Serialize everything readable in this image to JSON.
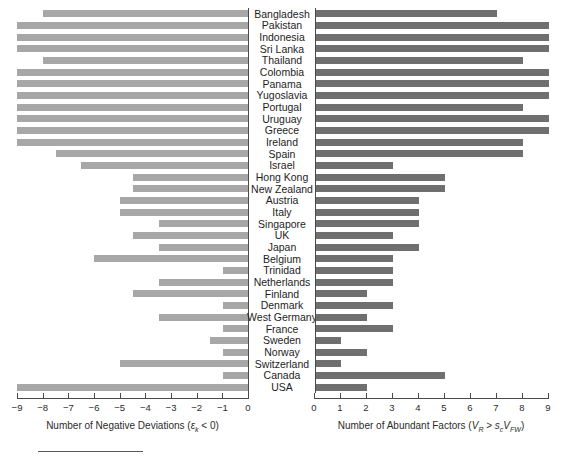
{
  "chart_data": {
    "type": "bar",
    "title": "",
    "orientation": "horizontal",
    "panels": "two-sided diverging (butterfly) bar chart",
    "categories": [
      "Bangladesh",
      "Pakistan",
      "Indonesia",
      "Sri Lanka",
      "Thailand",
      "Colombia",
      "Panama",
      "Yugoslavia",
      "Portugal",
      "Uruguay",
      "Greece",
      "Ireland",
      "Spain",
      "Israel",
      "Hong Kong",
      "New Zealand",
      "Austria",
      "Italy",
      "Singapore",
      "UK",
      "Japan",
      "Belgium",
      "Trinidad",
      "Netherlands",
      "Finland",
      "Denmark",
      "West Germany",
      "France",
      "Sweden",
      "Norway",
      "Switzerland",
      "Canada",
      "USA"
    ],
    "series": [
      {
        "name": "Number of Negative Deviations",
        "axis": "left",
        "color": "#a7a7a7",
        "direction": "left",
        "xlabel": "Number of Negative Deviations (εk < 0)",
        "xlim": [
          -9,
          0
        ],
        "xticks": [
          -9,
          -8,
          -7,
          -6,
          -5,
          -4,
          -3,
          -2,
          -1,
          0
        ],
        "values": [
          -8,
          -9,
          -9,
          -9,
          -8,
          -9,
          -9,
          -9,
          -9,
          -9,
          -9,
          -9,
          -7.5,
          -6.5,
          -4.5,
          -4.5,
          -5,
          -5,
          -3.5,
          -4.5,
          -3.5,
          -6,
          -1,
          -3.5,
          -4.5,
          -1,
          -3.5,
          -1,
          -1.5,
          -1,
          -5,
          -1,
          -9
        ]
      },
      {
        "name": "Number of Abundant Factors",
        "axis": "right",
        "color": "#6f6f6f",
        "direction": "right",
        "xlabel": "Number of Abundant Factors (VR > sc VFW)",
        "xlim": [
          0,
          9
        ],
        "xticks": [
          0,
          1,
          2,
          3,
          4,
          5,
          6,
          7,
          8,
          9
        ],
        "values": [
          7,
          9,
          9,
          9,
          8,
          9,
          9,
          9,
          8,
          9,
          9,
          8,
          8,
          3,
          5,
          5,
          4,
          4,
          4,
          3,
          4,
          3,
          3,
          3,
          2,
          3,
          2,
          3,
          1,
          2,
          1,
          5,
          2
        ]
      }
    ],
    "grid": false,
    "legend": "none"
  },
  "axis_left": {
    "ticks": [
      "−9",
      "−8",
      "−7",
      "−6",
      "−5",
      "−4",
      "−3",
      "−2",
      "−1",
      "0"
    ],
    "title_prefix": "Number of Negative Deviations (",
    "title_symbol": "ε",
    "title_sub": "k",
    "title_suffix": " < 0)"
  },
  "axis_right": {
    "ticks": [
      "0",
      "1",
      "2",
      "3",
      "4",
      "5",
      "6",
      "7",
      "8",
      "9"
    ],
    "title_prefix": "Number of Abundant Factors (",
    "title_v1": "V",
    "title_v1_sub": "R",
    "title_gt": " > ",
    "title_s": "s",
    "title_s_sub": "c",
    "title_v2": "V",
    "title_v2_sub": "FW",
    "title_suffix": ")"
  },
  "colors": {
    "left_bar": "#a7a7a7",
    "right_bar": "#6f6f6f",
    "axis": "#4a4a4a",
    "text": "#1d1d1d",
    "background": "#ffffff"
  }
}
